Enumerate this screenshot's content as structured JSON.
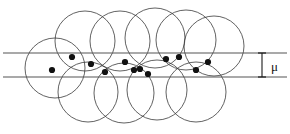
{
  "figure": {
    "background_color": "#ffffff",
    "width": 290,
    "height": 134,
    "circle_stroke_color": "#3a3a3a",
    "band_line_color": "#555555",
    "dot_color": "#111111",
    "annotation_color": "#1a1a1a"
  },
  "annotation": {
    "margin_symbol": "μ",
    "symbol_x": 271,
    "symbol_y": 71,
    "arrow_x": 262,
    "arrow_top": 53,
    "arrow_bottom": 77,
    "cap_half_width": 4
  },
  "band": {
    "upper_line_y": 53,
    "lower_line_y": 77,
    "line_x_start": 3,
    "line_x_end": 287,
    "margin_width": 24
  },
  "chart_data": {
    "type": "scatter",
    "xlabel": "",
    "ylabel": "",
    "xlim": [
      0,
      290
    ],
    "ylim": [
      0,
      134
    ],
    "grid": false,
    "legend": null,
    "annotations": [
      {
        "text": "μ",
        "x": 271,
        "y": 71,
        "kind": "margin-width-label"
      }
    ],
    "band_lines": [
      {
        "name": "upper-margin-line",
        "y": 53,
        "x_start": 3,
        "x_end": 287
      },
      {
        "name": "lower-margin-line",
        "y": 77,
        "x_start": 3,
        "x_end": 287
      }
    ],
    "circles": [
      {
        "cx": 55,
        "cy": 68,
        "r": 30,
        "row": "lower"
      },
      {
        "cx": 85,
        "cy": 41,
        "r": 30,
        "row": "upper"
      },
      {
        "cx": 88,
        "cy": 92,
        "r": 30,
        "row": "lower"
      },
      {
        "cx": 120,
        "cy": 41,
        "r": 30,
        "row": "upper"
      },
      {
        "cx": 124,
        "cy": 93,
        "r": 30,
        "row": "lower"
      },
      {
        "cx": 155,
        "cy": 38,
        "r": 30,
        "row": "upper"
      },
      {
        "cx": 157,
        "cy": 90,
        "r": 30,
        "row": "lower"
      },
      {
        "cx": 186,
        "cy": 40,
        "r": 30,
        "row": "upper"
      },
      {
        "cx": 196,
        "cy": 92,
        "r": 30,
        "row": "lower"
      },
      {
        "cx": 214,
        "cy": 46,
        "r": 30,
        "row": "upper"
      }
    ],
    "points": [
      {
        "x": 52,
        "y": 70
      },
      {
        "x": 72,
        "y": 57
      },
      {
        "x": 91,
        "y": 64
      },
      {
        "x": 105,
        "y": 72
      },
      {
        "x": 125,
        "y": 62
      },
      {
        "x": 134,
        "y": 70
      },
      {
        "x": 140,
        "y": 69
      },
      {
        "x": 148,
        "y": 74
      },
      {
        "x": 166,
        "y": 59
      },
      {
        "x": 179,
        "y": 57
      },
      {
        "x": 196,
        "y": 70
      },
      {
        "x": 208,
        "y": 62
      }
    ],
    "point_radius": 3.1
  }
}
